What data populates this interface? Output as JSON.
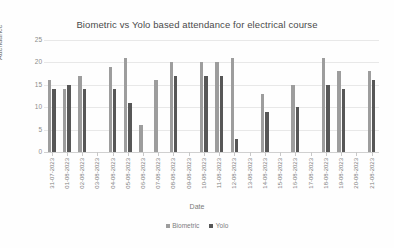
{
  "chart_data": {
    "type": "bar",
    "title": "Biometric vs Yolo based attendance for electrical course",
    "xlabel": "Date",
    "ylabel": "Attendance",
    "ylim": [
      0,
      25
    ],
    "yticks": [
      0,
      5,
      10,
      15,
      20,
      25
    ],
    "grid": true,
    "legend_position": "bottom",
    "categories": [
      "31-07-2023",
      "01-08-2023",
      "02-08-2023",
      "03-08-2023",
      "04-08-2023",
      "05-08-2023",
      "06-08-2023",
      "07-08-2023",
      "08-08-2023",
      "09-08-2023",
      "10-08-2023",
      "11-08-2023",
      "12-08-2023",
      "13-08-2023",
      "14-08-2023",
      "15-08-2023",
      "16-08-2023",
      "17-08-2023",
      "18-08-2023",
      "19-08-2023",
      "20-08-2023",
      "21-08-2023"
    ],
    "series": [
      {
        "name": "Biometric",
        "color": "#9d9d9d",
        "values": [
          16,
          14,
          15,
          17,
          19,
          21,
          6,
          16,
          20,
          20,
          20,
          21,
          3,
          0,
          13,
          15,
          21,
          18,
          18,
          0,
          0,
          0
        ]
      },
      {
        "name": "Yolo",
        "color": "#575757",
        "values": [
          14,
          15,
          14,
          14,
          14,
          11,
          0,
          17,
          17,
          17,
          0,
          0,
          0,
          0,
          9,
          10,
          15,
          14,
          16,
          0,
          0,
          0
        ]
      }
    ],
    "bar_groups": [
      {
        "date": "31-07-2023",
        "biometric": 16,
        "yolo": 14
      },
      {
        "date": "01-08-2023",
        "biometric": 14,
        "yolo": 15
      },
      {
        "date": "02-08-2023",
        "biometric": 17,
        "yolo": 14
      },
      {
        "date": "03-08-2023",
        "biometric": 0,
        "yolo": 0
      },
      {
        "date": "04-08-2023",
        "biometric": 19,
        "yolo": 14
      },
      {
        "date": "05-08-2023",
        "biometric": 21,
        "yolo": 11
      },
      {
        "date": "06-08-2023",
        "biometric": 6,
        "yolo": 0
      },
      {
        "date": "07-08-2023",
        "biometric": 16,
        "yolo": 0
      },
      {
        "date": "08-08-2023",
        "biometric": 20,
        "yolo": 17
      },
      {
        "date": "09-08-2023",
        "biometric": 0,
        "yolo": 0
      },
      {
        "date": "10-08-2023",
        "biometric": 20,
        "yolo": 17
      },
      {
        "date": "11-08-2023",
        "biometric": 20,
        "yolo": 17
      },
      {
        "date": "12-08-2023",
        "biometric": 21,
        "yolo": 3
      },
      {
        "date": "13-08-2023",
        "biometric": 0,
        "yolo": 0
      },
      {
        "date": "14-08-2023",
        "biometric": 13,
        "yolo": 9
      },
      {
        "date": "15-08-2023",
        "biometric": 0,
        "yolo": 0
      },
      {
        "date": "16-08-2023",
        "biometric": 15,
        "yolo": 10
      },
      {
        "date": "17-08-2023",
        "biometric": 0,
        "yolo": 0
      },
      {
        "date": "18-08-2023",
        "biometric": 21,
        "yolo": 15
      },
      {
        "date": "19-08-2023",
        "biometric": 18,
        "yolo": 14
      },
      {
        "date": "20-08-2023",
        "biometric": 0,
        "yolo": 0
      },
      {
        "date": "21-08-2023",
        "biometric": 18,
        "yolo": 16
      }
    ]
  }
}
